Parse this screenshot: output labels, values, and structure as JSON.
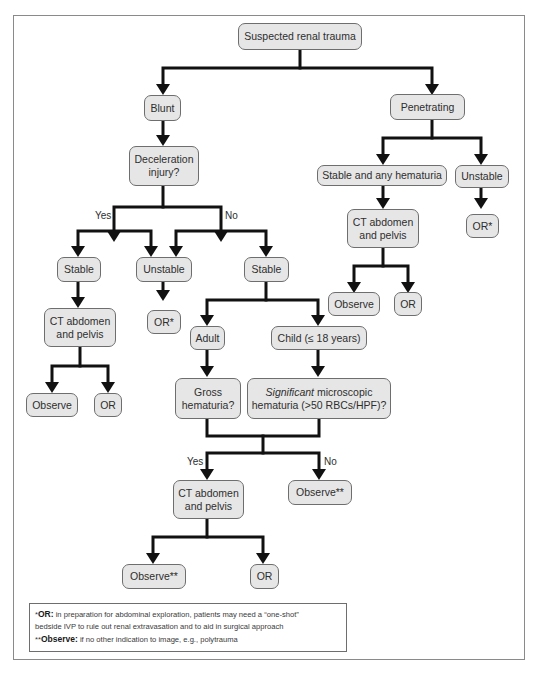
{
  "colors": {
    "node_fill": "#e6e6e6",
    "node_border": "#6e6e6e",
    "connector": "#111111",
    "frame": "#8a8a8a"
  },
  "nodes": {
    "root": "Suspected renal trauma",
    "blunt": "Blunt",
    "penetrating": "Penetrating",
    "deceleration": [
      "Deceleration",
      "injury?"
    ],
    "yes_stable": "Stable",
    "yes_unstable": "Unstable",
    "no_stable": "Stable",
    "yes_ct": [
      "CT abdomen",
      "and pelvis"
    ],
    "yes_observe": "Observe",
    "yes_or": "OR",
    "unstable_or": "OR*",
    "adult": "Adult",
    "child": "Child (≤ 18 years)",
    "gross": [
      "Gross",
      "hematuria?"
    ],
    "significant": {
      "italic": "Significant",
      "rest1": " microscopic",
      "line2": "hematuria (>50 RBCs/HPF)?"
    },
    "final_ct": [
      "CT abdomen",
      "and pelvis"
    ],
    "final_no_observe": "Observe**",
    "final_observe": "Observe**",
    "final_or": "OR",
    "pen_stable": "Stable and any hematuria",
    "pen_unstable": "Unstable",
    "pen_unstable_or": "OR*",
    "pen_ct": [
      "CT abdomen",
      "and pelvis"
    ],
    "pen_observe": "Observe",
    "pen_or": "OR"
  },
  "edge_labels": {
    "decel_yes": "Yes",
    "decel_no": "No",
    "hematuria_yes": "Yes",
    "hematuria_no": "No"
  },
  "footnotes": {
    "or_marker": "*",
    "or_term": "OR:",
    "or_text1": " in preparation for abdominal exploration, patients may need a “one-shot”",
    "or_text2": "bedside IVP to rule out renal extravasation and to aid in surgical approach",
    "observe_marker": "**",
    "observe_term": "Observe:",
    "observe_text": " if no other indication to image, e.g., polytrauma"
  }
}
